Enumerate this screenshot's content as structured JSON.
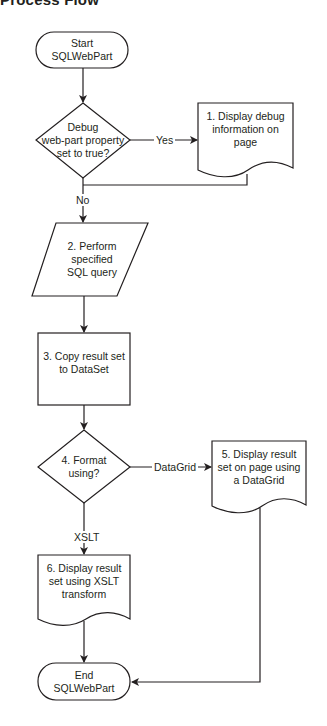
{
  "title": "Process Flow",
  "colors": {
    "stroke": "#231f20",
    "background": "#ffffff",
    "text": "#231f20"
  },
  "nodes": {
    "start": {
      "type": "terminator",
      "label": "Start\nSQLWebPart"
    },
    "debug_decision": {
      "type": "decision",
      "label": "Debug\nweb-part property\nset to true?"
    },
    "step1": {
      "type": "document",
      "label": "1. Display debug\ninformation on\npage"
    },
    "step2": {
      "type": "data-io",
      "label": "2. Perform\nspecified\nSQL query"
    },
    "step3": {
      "type": "process",
      "label": "3. Copy result set\nto DataSet"
    },
    "step4": {
      "type": "decision",
      "label": "4. Format\nusing?"
    },
    "step5": {
      "type": "document",
      "label": "5. Display result\nset on page using\na DataGrid"
    },
    "step6": {
      "type": "document",
      "label": "6. Display result\nset using XSLT\ntransform"
    },
    "end": {
      "type": "terminator",
      "label": "End\nSQLWebPart"
    }
  },
  "edges": {
    "yes_label": "Yes",
    "no_label": "No",
    "datagrid_label": "DataGrid",
    "xslt_label": "XSLT"
  }
}
